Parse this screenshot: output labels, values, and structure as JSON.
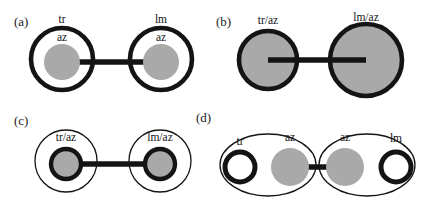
{
  "figure": {
    "width": 423,
    "height": 207,
    "background": "#ffffff",
    "outline_color": "#141414",
    "fill_gray": "#a9a9a9",
    "fill_white": "#ffffff"
  },
  "panels": [
    {
      "id": "a",
      "label": "(a)",
      "label_x": 14,
      "label_y": 26,
      "description": "Two thick-outlined white shells, each containing a small gray core labeled az; outer shells labeled tr and lm; joined by a horizontal bar.",
      "outer_shells": [
        {
          "name": "left-shell",
          "cx": 62,
          "cy": 59,
          "r": 31,
          "style": "shell-thick",
          "label": "tr",
          "label_x": 62,
          "label_y": 23
        },
        {
          "name": "right-shell",
          "cx": 161,
          "cy": 59,
          "r": 31,
          "style": "shell-thick",
          "label": "lm",
          "label_x": 161,
          "label_y": 23
        }
      ],
      "cores": [
        {
          "name": "left-core",
          "cx": 62,
          "cy": 62,
          "r": 18,
          "style": "core-gray",
          "label": "az",
          "label_x": 62,
          "label_y": 41
        },
        {
          "name": "right-core",
          "cx": 161,
          "cy": 62,
          "r": 18,
          "style": "core-gray",
          "label": "az",
          "label_x": 161,
          "label_y": 41
        }
      ],
      "links": [
        {
          "name": "center-link",
          "x1": 62,
          "y1": 62,
          "x2": 161,
          "y2": 62,
          "style": "link-bar"
        }
      ]
    },
    {
      "id": "b",
      "label": "(b)",
      "label_x": 216,
      "label_y": 26,
      "description": "Two fully gray-filled thick-outlined circles labeled tr/az and lm/az, joined by a horizontal bar; right circle is larger.",
      "outer_shells": [
        {
          "name": "left-disc",
          "cx": 268,
          "cy": 60,
          "r": 29,
          "style": "core-filled-shell",
          "label": "tr/az",
          "label_x": 268,
          "label_y": 24
        },
        {
          "name": "right-disc",
          "cx": 366,
          "cy": 60,
          "r": 36,
          "style": "core-filled-shell",
          "label": "lm/az",
          "label_x": 366,
          "label_y": 21
        }
      ],
      "cores": [],
      "links": [
        {
          "name": "center-link",
          "x1": 268,
          "y1": 60,
          "x2": 366,
          "y2": 60,
          "style": "link-bar"
        }
      ]
    },
    {
      "id": "c",
      "label": "(c)",
      "label_x": 14,
      "label_y": 125,
      "description": "Two thin-outlined white shells, each containing a thick-ringed gray core labeled tr/az and lm/az, joined by a horizontal bar.",
      "outer_shells": [
        {
          "name": "left-shell",
          "cx": 66,
          "cy": 161,
          "r": 31,
          "style": "shell-thin",
          "label": "tr/az",
          "label_x": 66,
          "label_y": 141
        },
        {
          "name": "right-shell",
          "cx": 160,
          "cy": 161,
          "r": 31,
          "style": "shell-thin",
          "label": "lm/az",
          "label_x": 160,
          "label_y": 141
        }
      ],
      "cores": [
        {
          "name": "left-core",
          "cx": 66,
          "cy": 164,
          "r": 15,
          "style": "core-gray-ringed",
          "label": "",
          "label_x": 0,
          "label_y": 0
        },
        {
          "name": "right-core",
          "cx": 160,
          "cy": 164,
          "r": 15,
          "style": "core-gray-ringed",
          "label": "",
          "label_x": 0,
          "label_y": 0
        }
      ],
      "links": [
        {
          "name": "center-link",
          "x1": 66,
          "y1": 164,
          "x2": 160,
          "y2": 164,
          "style": "link-bar"
        }
      ]
    },
    {
      "id": "d",
      "label": "(d)",
      "label_x": 196,
      "label_y": 122,
      "description": "Two thin-outlined ellipses; each holds an open thick black ring (tr, lm) and a solid gray disc (az); the two gray discs are joined by a horizontal bar.",
      "ellipses": [
        {
          "name": "left-ellipse",
          "cx": 268,
          "cy": 165,
          "rx": 48,
          "ry": 31,
          "style": "shell-thin"
        },
        {
          "name": "right-ellipse",
          "cx": 367,
          "cy": 165,
          "rx": 48,
          "ry": 31,
          "style": "shell-thin"
        }
      ],
      "outer_shells": [],
      "cores": [
        {
          "name": "tr-ring",
          "cx": 240,
          "cy": 167,
          "r": 15,
          "style": "ring-open",
          "label": "tr",
          "label_x": 240,
          "label_y": 145
        },
        {
          "name": "left-az-disc",
          "cx": 290,
          "cy": 167,
          "r": 19,
          "style": "core-gray",
          "label": "az",
          "label_x": 290,
          "label_y": 141
        },
        {
          "name": "right-az-disc",
          "cx": 345,
          "cy": 167,
          "r": 19,
          "style": "core-gray",
          "label": "az",
          "label_x": 345,
          "label_y": 141
        },
        {
          "name": "lm-ring",
          "cx": 396,
          "cy": 167,
          "r": 15,
          "style": "ring-open",
          "label": "lm",
          "label_x": 396,
          "label_y": 142
        }
      ],
      "links": [
        {
          "name": "center-link",
          "x1": 290,
          "y1": 167,
          "x2": 345,
          "y2": 167,
          "style": "link-bar"
        }
      ]
    }
  ]
}
